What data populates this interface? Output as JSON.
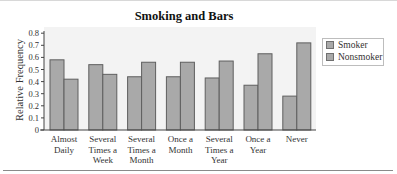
{
  "chart_data": {
    "type": "bar",
    "title": "Smoking and Bars",
    "xlabel": "",
    "ylabel": "Relative Frequency",
    "ylim": [
      0,
      0.8
    ],
    "yticks": [
      0,
      0.1,
      0.2,
      0.3,
      0.4,
      0.5,
      0.6,
      0.7,
      0.8
    ],
    "ytick_labels": [
      "0",
      "0.1",
      "0.2",
      "0.3",
      "0.4",
      "0.5",
      "0.6",
      "0.7",
      "0.8"
    ],
    "categories": [
      [
        "Almost",
        "Daily"
      ],
      [
        "Several",
        "Times a",
        "Week"
      ],
      [
        "Several",
        "Times a",
        "Month"
      ],
      [
        "Once a",
        "Month"
      ],
      [
        "Several",
        "Times a",
        "Year"
      ],
      [
        "Once a",
        "Year"
      ],
      [
        "Never"
      ]
    ],
    "category_names": [
      "Almost Daily",
      "Several Times a Week",
      "Several Times a Month",
      "Once a Month",
      "Several Times a Year",
      "Once a Year",
      "Never"
    ],
    "series": [
      {
        "name": "Smoker",
        "color": "#a9a9a9",
        "values": [
          0.58,
          0.54,
          0.44,
          0.44,
          0.43,
          0.37,
          0.28
        ]
      },
      {
        "name": "Nonsmoker",
        "color": "#a9a9a9",
        "values": [
          0.42,
          0.46,
          0.56,
          0.56,
          0.57,
          0.63,
          0.72
        ]
      }
    ],
    "grid": false,
    "legend_position": "right",
    "plot_background": "#f3f3f3",
    "bar_edge_color": "#5f5f5f"
  },
  "legend": {
    "items": [
      {
        "label": "Smoker"
      },
      {
        "label": "Nonsmoker"
      }
    ]
  }
}
